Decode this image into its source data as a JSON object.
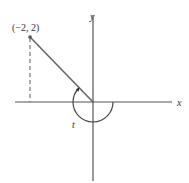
{
  "diagram": {
    "type": "coordinate-plane-angle",
    "axes": {
      "x_label": "x",
      "y_label": "y"
    },
    "point": {
      "label": "(−2, 2)",
      "coords": [
        -2,
        2
      ]
    },
    "angle": {
      "label": "t",
      "direction": "clockwise-negative",
      "terminal_side_through": "(−2, 2)"
    },
    "colors": {
      "axis": "#555555",
      "terminal_line": "#666666",
      "text": "#333333",
      "dashed": "#777777"
    }
  }
}
